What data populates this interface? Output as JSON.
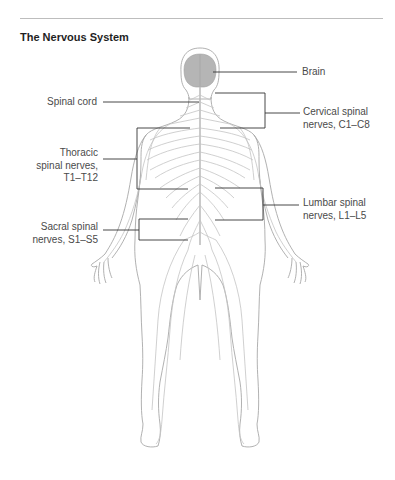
{
  "figure": {
    "title": "The Nervous System",
    "labels": {
      "brain": "Brain",
      "spinal_cord": "Spinal cord",
      "cervical_line1": "Cervical spinal",
      "cervical_line2": "nerves, C1–C8",
      "thoracic_line1": "Thoracic",
      "thoracic_line2": "spinal nerves,",
      "thoracic_line3": "T1–T12",
      "lumbar_line1": "Lumbar spinal",
      "lumbar_line2": "nerves, L1–L5",
      "sacral_line1": "Sacral spinal",
      "sacral_line2": "nerves, S1–S5"
    },
    "colors": {
      "brain_fill": "#b5b5b5",
      "body_outline": "#a8a8a8",
      "nerve": "#c4c4c4",
      "leader_line": "#333333"
    }
  }
}
